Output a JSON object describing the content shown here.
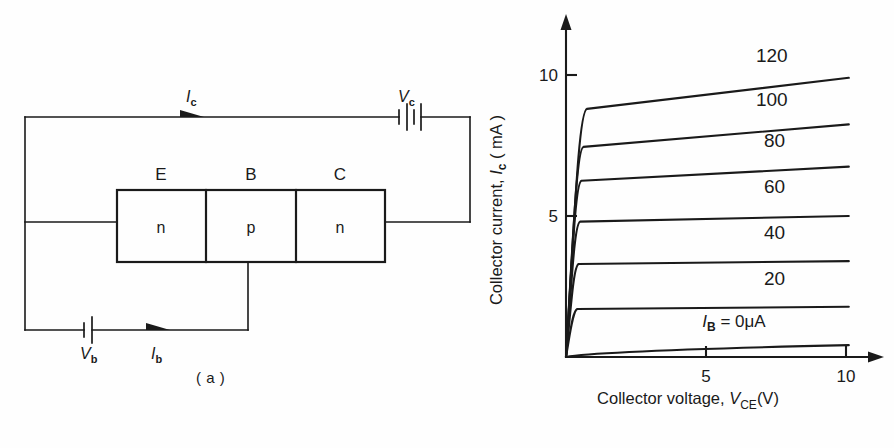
{
  "figure": {
    "panel_a": {
      "caption": "( a )",
      "circuit_labels": {
        "collector_current": "I",
        "collector_current_sub": "c",
        "base_current": "I",
        "base_current_sub": "b",
        "collector_supply": "V",
        "collector_supply_sub": "c",
        "base_supply": "V",
        "base_supply_sub": "b"
      },
      "terminals": [
        {
          "letter": "E",
          "region": "n"
        },
        {
          "letter": "B",
          "region": "p"
        },
        {
          "letter": "C",
          "region": "n"
        }
      ]
    },
    "panel_b": {
      "caption": "( b )"
    }
  },
  "chart_data": {
    "type": "line",
    "title": "",
    "xlabel_parts": {
      "text": "Collector voltage, ",
      "symbol": "V",
      "sub": "CE",
      "unit": "(V)"
    },
    "ylabel_parts": {
      "text": "Collector current, ",
      "symbol": "I",
      "sub": "c",
      "unit": "( mA )"
    },
    "xlim": [
      0,
      11.2
    ],
    "ylim": [
      0,
      11.5
    ],
    "xticks": [
      5,
      10
    ],
    "xticklabels": [
      "5",
      "10"
    ],
    "yticks": [
      5,
      10
    ],
    "yticklabels": [
      "5",
      "10"
    ],
    "grid": false,
    "legend_position": "inline-on-curve",
    "annotation_zero_curve": {
      "symbol": "I",
      "sub": "B",
      "value": " = 0μA"
    },
    "series": [
      {
        "name": "120",
        "label": "120",
        "knee_x": 0.75,
        "knee_y": 8.8,
        "end_x": 10.1,
        "end_y": 9.9,
        "label_x": 7.35,
        "label_y": 10.45
      },
      {
        "name": "100",
        "label": "100",
        "knee_x": 0.62,
        "knee_y": 7.45,
        "end_x": 10.1,
        "end_y": 8.25,
        "label_x": 7.35,
        "label_y": 8.9
      },
      {
        "name": "80",
        "label": "80",
        "knee_x": 0.55,
        "knee_y": 6.25,
        "end_x": 10.1,
        "end_y": 6.75,
        "label_x": 7.45,
        "label_y": 7.45
      },
      {
        "name": "60",
        "label": "60",
        "knee_x": 0.5,
        "knee_y": 4.8,
        "end_x": 10.1,
        "end_y": 5.0,
        "label_x": 7.45,
        "label_y": 5.8
      },
      {
        "name": "40",
        "label": "40",
        "knee_x": 0.45,
        "knee_y": 3.3,
        "end_x": 10.1,
        "end_y": 3.4,
        "label_x": 7.45,
        "label_y": 4.2
      },
      {
        "name": "20",
        "label": "20",
        "knee_x": 0.4,
        "knee_y": 1.7,
        "end_x": 10.1,
        "end_y": 1.78,
        "label_x": 7.45,
        "label_y": 2.55
      },
      {
        "name": "0",
        "label": "",
        "knee_x": 0.1,
        "knee_y": 0.1,
        "end_x": 10.1,
        "end_y": 0.42,
        "label_x": 0,
        "label_y": 0
      }
    ],
    "ylabel": "Collector current, I c ( mA )",
    "xlabel": "Collector voltage, V CE (V)"
  }
}
